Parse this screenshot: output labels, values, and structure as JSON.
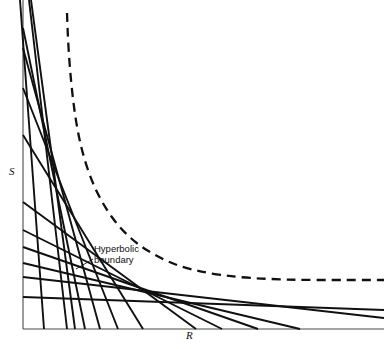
{
  "figure": {
    "title": "",
    "background_color": "#ffffff",
    "line_color": "#101010",
    "width": 384,
    "height": 349
  },
  "axes": {
    "x_label": "R",
    "y_label": "S",
    "origin_px": [
      23,
      329
    ],
    "x_end_px": [
      384,
      329
    ],
    "y_end_px": [
      23,
      0
    ],
    "ticks": false,
    "grid": false
  },
  "annotations": [
    {
      "name": "hyperbolic-boundary",
      "text_line1": "Hyperbolic",
      "text_line2": "boundary",
      "text_px": [
        94,
        243
      ],
      "leader_from_px": [
        93,
        259
      ],
      "leader_to_px": [
        76,
        269
      ]
    }
  ],
  "chart_data": {
    "type": "line",
    "title": "",
    "xlabel": "R",
    "ylabel": "S",
    "grid": false,
    "legend": null,
    "series": [
      {
        "name": "hyperbolic-boundary",
        "style": "dashed",
        "color": "#101010",
        "points_px": [
          [
            67,
            13
          ],
          [
            68,
            40
          ],
          [
            70,
            70
          ],
          [
            73,
            100
          ],
          [
            77,
            128
          ],
          [
            83,
            155
          ],
          [
            92,
            182
          ],
          [
            104,
            206
          ],
          [
            119,
            227
          ],
          [
            137,
            244
          ],
          [
            158,
            257
          ],
          [
            181,
            267
          ],
          [
            207,
            273
          ],
          [
            236,
            277
          ],
          [
            268,
            279
          ],
          [
            302,
            280
          ],
          [
            340,
            280
          ],
          [
            384,
            280
          ]
        ]
      },
      {
        "name": "envelope-tangent-lines",
        "style": "solid",
        "color": "#101010",
        "lines_px": [
          [
            [
              20,
              0
            ],
            [
              44,
              329
            ]
          ],
          [
            [
              29,
              0
            ],
            [
              67,
              329
            ]
          ],
          [
            [
              31,
              0
            ],
            [
              75,
              329
            ]
          ],
          [
            [
              23,
              28
            ],
            [
              85,
              329
            ]
          ],
          [
            [
              23,
              48
            ],
            [
              100,
              329
            ]
          ],
          [
            [
              23,
              88
            ],
            [
              118,
              329
            ]
          ],
          [
            [
              23,
              135
            ],
            [
              143,
              329
            ]
          ],
          [
            [
              23,
              202
            ],
            [
              196,
              329
            ]
          ],
          [
            [
              23,
              230
            ],
            [
              222,
              329
            ]
          ],
          [
            [
              23,
              247
            ],
            [
              258,
              329
            ]
          ],
          [
            [
              23,
              263
            ],
            [
              300,
              329
            ]
          ],
          [
            [
              23,
              277
            ],
            [
              384,
              318
            ]
          ],
          [
            [
              23,
              297
            ],
            [
              384,
              310
            ]
          ]
        ]
      }
    ]
  }
}
